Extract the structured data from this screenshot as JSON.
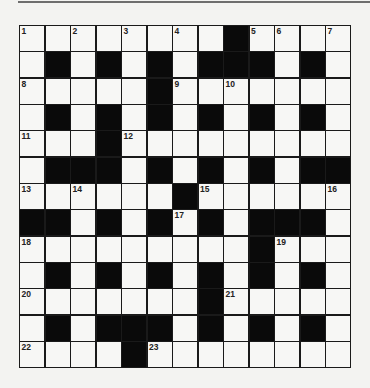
{
  "puzzle": {
    "type": "crossword",
    "rows": 13,
    "cols": 13,
    "black_cells": {
      "0": [
        8
      ],
      "1": [
        1,
        3,
        5,
        7,
        8,
        9,
        11
      ],
      "2": [
        5
      ],
      "3": [
        1,
        3,
        5,
        7,
        9,
        11
      ],
      "4": [
        3
      ],
      "5": [
        1,
        2,
        3,
        5,
        7,
        9,
        11,
        12
      ],
      "6": [
        6
      ],
      "7": [
        0,
        1,
        3,
        5,
        7,
        9,
        10,
        11
      ],
      "8": [
        9
      ],
      "9": [
        1,
        3,
        5,
        7,
        9,
        11
      ],
      "10": [
        7
      ],
      "11": [
        1,
        3,
        4,
        5,
        7,
        9,
        11
      ],
      "12": [
        4
      ]
    },
    "numbers": [
      {
        "n": "1",
        "r": 0,
        "c": 0
      },
      {
        "n": "2",
        "r": 0,
        "c": 2
      },
      {
        "n": "3",
        "r": 0,
        "c": 4
      },
      {
        "n": "4",
        "r": 0,
        "c": 6
      },
      {
        "n": "5",
        "r": 0,
        "c": 9
      },
      {
        "n": "6",
        "r": 0,
        "c": 10
      },
      {
        "n": "7",
        "r": 0,
        "c": 12
      },
      {
        "n": "8",
        "r": 2,
        "c": 0
      },
      {
        "n": "9",
        "r": 2,
        "c": 6
      },
      {
        "n": "10",
        "r": 2,
        "c": 8
      },
      {
        "n": "11",
        "r": 4,
        "c": 0
      },
      {
        "n": "12",
        "r": 4,
        "c": 4
      },
      {
        "n": "13",
        "r": 6,
        "c": 0
      },
      {
        "n": "14",
        "r": 6,
        "c": 2
      },
      {
        "n": "15",
        "r": 6,
        "c": 7
      },
      {
        "n": "16",
        "r": 6,
        "c": 12
      },
      {
        "n": "17",
        "r": 7,
        "c": 6
      },
      {
        "n": "18",
        "r": 8,
        "c": 0
      },
      {
        "n": "19",
        "r": 8,
        "c": 10
      },
      {
        "n": "20",
        "r": 10,
        "c": 0
      },
      {
        "n": "21",
        "r": 10,
        "c": 8
      },
      {
        "n": "22",
        "r": 12,
        "c": 0
      },
      {
        "n": "23",
        "r": 12,
        "c": 5
      }
    ],
    "colors": {
      "black_cell": "#0a0a0a",
      "white_cell": "#f7f7f5",
      "grid_line": "#1a1a1a"
    }
  }
}
